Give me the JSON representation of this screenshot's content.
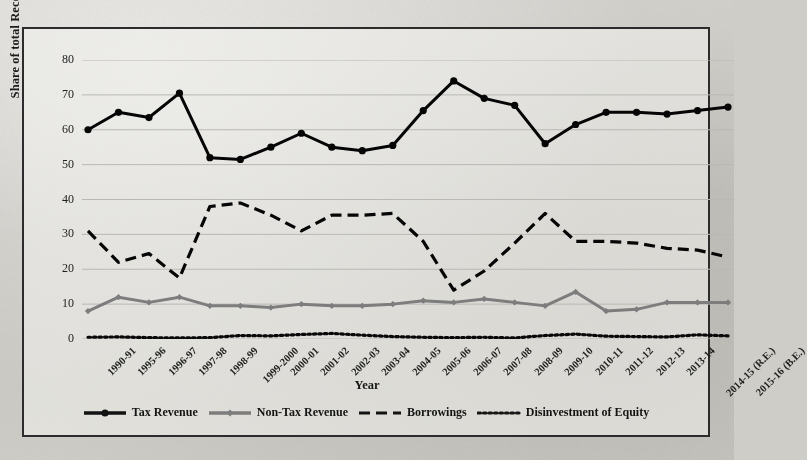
{
  "chart_data": {
    "type": "line",
    "title": "",
    "xlabel": "Year",
    "ylabel": "Share of total Receipts (in %)",
    "ylim": [
      0,
      80
    ],
    "yticks": [
      0,
      10,
      20,
      30,
      40,
      50,
      60,
      70,
      80
    ],
    "grid": true,
    "legend_position": "bottom",
    "categories": [
      "1990-91",
      "1995-96",
      "1996-97",
      "1997-98",
      "1998-99",
      "1999-2000",
      "2000-01",
      "2001-02",
      "2002-03",
      "2003-04",
      "2004-05",
      "2005-06",
      "2006-07",
      "2007-08",
      "2008-09",
      "2009-10",
      "2010-11",
      "2011-12",
      "2012-13",
      "2013-14",
      "2014-15 (R.E.)",
      "2015-16 (B.E.)"
    ],
    "series": [
      {
        "name": "Tax Revenue",
        "color": "#121212",
        "style": "solid",
        "marker": "circle",
        "values": [
          60.0,
          65.0,
          63.5,
          70.5,
          52.0,
          51.5,
          55.0,
          59.0,
          55.0,
          54.0,
          55.5,
          65.5,
          74.0,
          69.0,
          67.0,
          56.0,
          61.5,
          65.0,
          65.0,
          64.5,
          65.5,
          66.5
        ]
      },
      {
        "name": "Non-Tax Revenue",
        "color": "#7d7d7d",
        "style": "solid",
        "marker": "diamond",
        "values": [
          8.0,
          12.0,
          10.5,
          12.0,
          9.5,
          9.5,
          9.0,
          10.0,
          9.5,
          9.5,
          10.0,
          11.0,
          10.5,
          11.5,
          10.5,
          9.5,
          13.5,
          8.0,
          8.5,
          10.5,
          10.5,
          10.5
        ]
      },
      {
        "name": "Borrowings",
        "color": "#131313",
        "style": "dashed",
        "marker": "none",
        "values": [
          31.0,
          22.0,
          24.5,
          17.5,
          38.0,
          39.0,
          35.5,
          31.0,
          35.5,
          35.5,
          36.0,
          28.0,
          14.0,
          19.5,
          27.5,
          36.0,
          28.0,
          28.0,
          27.5,
          26.0,
          25.5,
          23.5
        ]
      },
      {
        "name": "Disinvestment of Equity",
        "color": "#151515",
        "style": "dotted",
        "marker": "none",
        "values": [
          0.5,
          0.6,
          0.4,
          0.3,
          0.4,
          1.0,
          0.9,
          1.3,
          1.6,
          1.1,
          0.7,
          0.5,
          0.4,
          0.5,
          0.3,
          1.0,
          1.4,
          0.8,
          0.7,
          0.6,
          1.2,
          0.9
        ]
      }
    ]
  },
  "axis": {
    "y_title": "Share of total Receipts (in %)",
    "x_title": "Year",
    "y_tick_labels": [
      "80",
      "70",
      "60",
      "50",
      "40",
      "30",
      "20",
      "10",
      "0"
    ]
  },
  "legend": {
    "items": [
      {
        "label": "Tax Revenue",
        "key": "solid-marker-black"
      },
      {
        "label": "Non-Tax Revenue",
        "key": "solid-marker-gray"
      },
      {
        "label": "Borrowings",
        "key": "dashed-black"
      },
      {
        "label": "Disinvestment of Equity",
        "key": "dotted-black"
      }
    ]
  }
}
